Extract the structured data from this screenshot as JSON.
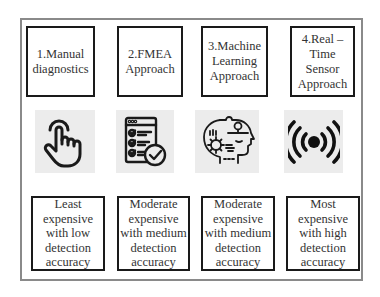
{
  "approaches": [
    {
      "title": "1.Manual\ndiagnostics",
      "icon": "hand-pointer-icon",
      "description": "Least\nexpensive\nwith low\ndetection\naccuracy"
    },
    {
      "title": "2.FMEA\nApproach",
      "icon": "checklist-icon",
      "description": "Moderate\nexpensive\nwith medium\ndetection\naccuracy"
    },
    {
      "title": "3.Machine\nLearning\nApproach",
      "icon": "brain-gear-head-icon",
      "description": "Moderate\nexpensive\nwith medium\ndetection\naccuracy"
    },
    {
      "title": "4.Real –\nTime\nSensor\nApproach",
      "icon": "sensor-signal-icon",
      "description": "Most\nexpensive\nwith high\ndetection\naccuracy"
    }
  ],
  "colors": {
    "frame_border": "#8a8a8a",
    "box_border": "#1a1a1a",
    "icon_background": "#ececec",
    "icon_stroke": "#1a1a1a"
  }
}
